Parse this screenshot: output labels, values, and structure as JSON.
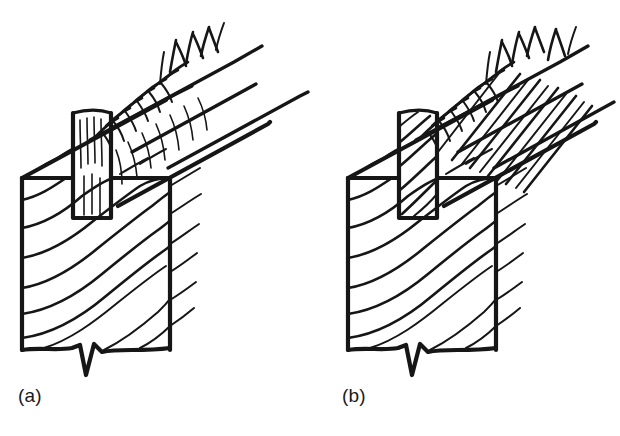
{
  "figure": {
    "kind": "line-drawing",
    "background_color": "#ffffff",
    "ink_color": "#161616",
    "panels": [
      {
        "id": "a",
        "caption": "(a)",
        "caption_x": 18,
        "caption_y": 385,
        "tenon_grain": "straight vertical grain",
        "brace_grain": "straight longitudinal grain",
        "description": "Post with mortise receiving a tenoned diagonal brace; brace grain runs parallel to the brace axis"
      },
      {
        "id": "b",
        "caption": "(b)",
        "caption_x": 342,
        "caption_y": 385,
        "tenon_grain": "diagonal sloping grain",
        "brace_grain": "steeply sloping cross grain",
        "description": "Same joint but the brace and tenon are cut with sloping grain running out of the member"
      }
    ],
    "post": {
      "width": 148,
      "height": 175,
      "top_y": 175,
      "bottom_y": 350,
      "break_symbol": "zigzag-break-line"
    },
    "icons": {
      "break_line": "zigzag-break-icon",
      "grain_hatch": "wood-grain-icon"
    }
  }
}
